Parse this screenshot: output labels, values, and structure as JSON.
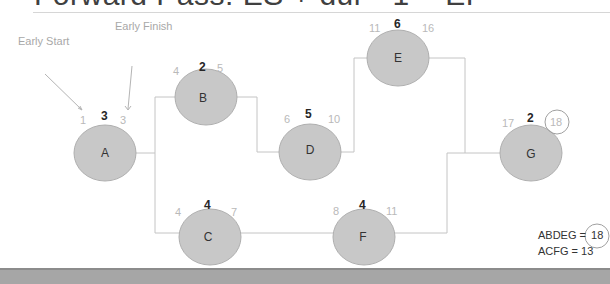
{
  "title": "Forward Pass: ES + dur - 1 = EF",
  "annotations": {
    "early_start": "Early Start",
    "early_finish": "Early Finish"
  },
  "nodes": {
    "A": {
      "label": "A",
      "es": "1",
      "dur": "3",
      "ef": "3"
    },
    "B": {
      "label": "B",
      "es": "4",
      "dur": "2",
      "ef": "5"
    },
    "C": {
      "label": "C",
      "es": "4",
      "dur": "4",
      "ef": "7"
    },
    "D": {
      "label": "D",
      "es": "6",
      "dur": "5",
      "ef": "10"
    },
    "E": {
      "label": "E",
      "es": "11",
      "dur": "6",
      "ef": "16"
    },
    "F": {
      "label": "F",
      "es": "8",
      "dur": "4",
      "ef": "11"
    },
    "G": {
      "label": "G",
      "es": "17",
      "dur": "2",
      "ef": "18"
    }
  },
  "paths": [
    {
      "label": "ABDEG =",
      "total": "18",
      "highlighted": true
    },
    {
      "label": "ACFG = 13",
      "total": "",
      "highlighted": false
    }
  ],
  "colors": {
    "node_fill": "#c8c8c8",
    "node_stroke": "#b0b0b0",
    "connector": "#c4c4c4",
    "muted_text": "#b9b9b9"
  }
}
